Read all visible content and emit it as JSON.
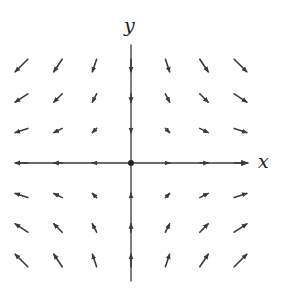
{
  "diagram": {
    "type": "vector-field",
    "x_axis_label": "x",
    "y_axis_label": "y",
    "grid_points": [
      -3,
      -2,
      -1,
      0,
      1,
      2,
      3
    ],
    "field": {
      "fx": "x",
      "fy": "-y"
    },
    "colors": {
      "axis": "#3a3a3a",
      "arrow": "#3a3a3a",
      "background": "#ffffff"
    }
  },
  "layout": {
    "origin_px": [
      131,
      163
    ],
    "spacing_px": [
      36.5,
      32.5
    ],
    "x_axis_px": [
      17,
      248
    ],
    "y_axis_px": [
      45,
      281
    ]
  }
}
